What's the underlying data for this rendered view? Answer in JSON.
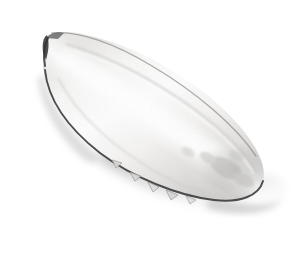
{
  "image": {
    "kind": "natural-image",
    "subject_name": "cuttlebone",
    "subject_description": "Isolated cuttlefish bone (cuttlebone), elongated lanceolate shell photographed on a plain white background",
    "caption": "",
    "width": 303,
    "height": 254,
    "background_color": "#ffffff",
    "orientation_degrees": -33,
    "lighting": "diffuse light from upper left"
  },
  "palette": {
    "background": "#ffffff",
    "body_highlight": "#fdfdfd",
    "body_light": "#f2f2f1",
    "body_mid": "#dedddb",
    "body_shade": "#c4c3c1",
    "body_deep_shade": "#a8a7a5",
    "rim_outline": "#4a4a4a",
    "rim_outline_dark": "#2e2e2e",
    "cast_shadow": "#c9c9c9",
    "cast_shadow_soft": "#e0e0e0",
    "texture_mottle": "#b6b5b3"
  },
  "subject": {
    "shape": "lanceolate-ellipse",
    "tip_end": {
      "name": "pointed-anterior-tip",
      "position": "upper-left",
      "x": 48,
      "y": 36,
      "form": "narrow pointed beak with dark notch"
    },
    "blunt_end": {
      "name": "rounded-posterior-end",
      "position": "lower-right",
      "x": 262,
      "y": 190,
      "form": "broad rounded lobe"
    },
    "long_axis_length": 252,
    "max_width": 104,
    "outline_stroke_color": "#4a4a4a",
    "surface": {
      "center_highlight": "bright near-white band along long axis",
      "ridge": "faint dorsal ridge parallel to upper-right margin",
      "mottling": "grey mottled patches near posterior end"
    }
  },
  "features": [
    {
      "name": "serrated-lower-margin",
      "description": "small triangular notches along the ventral rim",
      "notch_count": 5
    },
    {
      "name": "dark-rim-line",
      "description": "thin dark outline tracing the lower-left and lower-right margin"
    },
    {
      "name": "cast-shadow",
      "description": "soft grey wedge shadow below and right of the body"
    },
    {
      "name": "left-flank-shade",
      "description": "grey shading band along the lower-left flank"
    }
  ]
}
